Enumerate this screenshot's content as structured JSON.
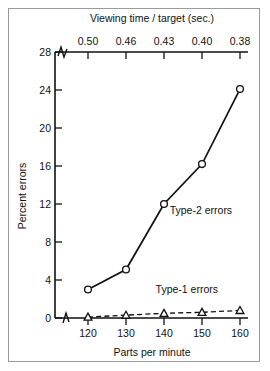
{
  "chart_data": {
    "type": "line",
    "title": "",
    "xlabel": "Parts per minute",
    "ylabel": "Percent errors",
    "secondary_xlabel": "Viewing time / target (sec.)",
    "x": [
      120,
      130,
      140,
      150,
      160
    ],
    "categories": [
      "120",
      "130",
      "140",
      "150",
      "160"
    ],
    "xtick_labels": [
      "120",
      "130",
      "140",
      "150",
      "160"
    ],
    "secondary_xtick_labels": [
      "0.50",
      "0.46",
      "0.43",
      "0.40",
      "0.38"
    ],
    "ytick_labels": [
      "0",
      "4",
      "8",
      "12",
      "16",
      "20",
      "24",
      "28"
    ],
    "ytick_values": [
      0,
      4,
      8,
      12,
      16,
      20,
      24,
      28
    ],
    "xlim": [
      115,
      165
    ],
    "ylim": [
      0,
      28
    ],
    "grid": false,
    "legend": "inline-annotations",
    "axis_break_y_bottom": true,
    "axis_break_y_top": true,
    "series": [
      {
        "name": "Type-2 errors",
        "label": "Type-2 errors",
        "line_style": "solid",
        "marker": "open-circle",
        "values": [
          3.0,
          5.1,
          12.0,
          16.2,
          24.1
        ]
      },
      {
        "name": "Type-1 errors",
        "label": "Type-1 errors",
        "line_style": "dashed",
        "marker": "open-triangle",
        "values": [
          0.1,
          0.3,
          0.5,
          0.6,
          0.8
        ]
      }
    ],
    "annotations": [
      {
        "text": "Type-2 errors",
        "x": 141.5,
        "y": 11.0
      },
      {
        "text": "Type-1 errors",
        "x": 146.0,
        "y": 2.6
      }
    ],
    "colors": {
      "line": "#111111",
      "marker_fill": "#ffffff",
      "axis": "#111111",
      "background": "#ffffff",
      "frame": "#9a9a9a"
    }
  }
}
